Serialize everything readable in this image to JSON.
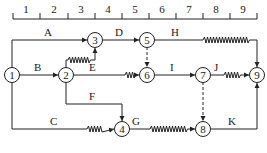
{
  "scale": {
    "labels": [
      "1",
      "2",
      "3",
      "4",
      "5",
      "6",
      "7",
      "8",
      "9"
    ]
  },
  "nodes": [
    {
      "id": "1",
      "label": "1"
    },
    {
      "id": "2",
      "label": "2"
    },
    {
      "id": "3",
      "label": "3"
    },
    {
      "id": "4",
      "label": "4"
    },
    {
      "id": "5",
      "label": "5"
    },
    {
      "id": "6",
      "label": "6"
    },
    {
      "id": "7",
      "label": "7"
    },
    {
      "id": "8",
      "label": "8"
    },
    {
      "id": "9",
      "label": "9"
    }
  ],
  "activities": {
    "A": "A",
    "B": "B",
    "C": "C",
    "D": "D",
    "E": "E",
    "F": "F",
    "G": "G",
    "H": "H",
    "I": "I",
    "J": "J",
    "K": "K"
  }
}
